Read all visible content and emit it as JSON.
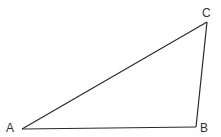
{
  "diagram": {
    "type": "triangle",
    "vertices": [
      {
        "id": "A",
        "label": "A"
      },
      {
        "id": "B",
        "label": "B"
      },
      {
        "id": "C",
        "label": "C"
      }
    ],
    "edges": [
      {
        "from": "A",
        "to": "B"
      },
      {
        "from": "B",
        "to": "C"
      },
      {
        "from": "C",
        "to": "A"
      }
    ],
    "line_color": "#2a2a2a",
    "label_color": "#333333"
  }
}
